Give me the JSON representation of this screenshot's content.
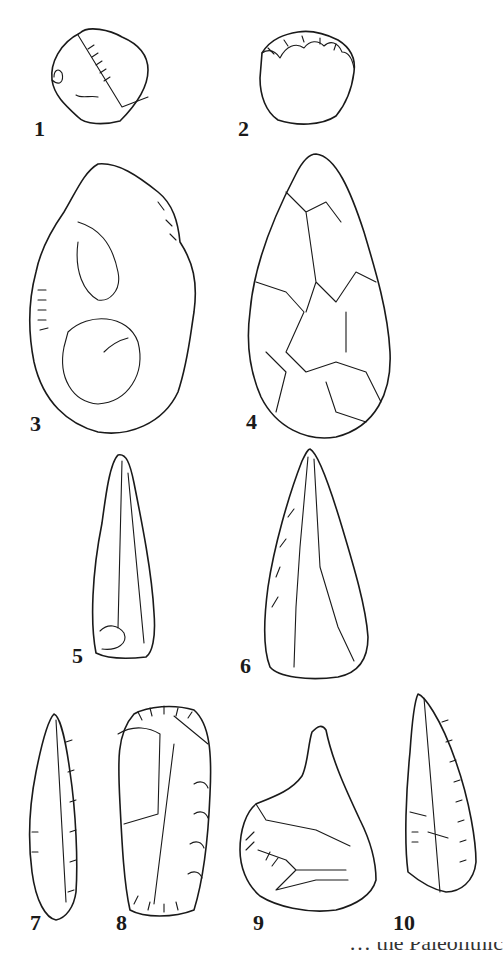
{
  "figure": {
    "items": [
      {
        "number": "1",
        "description": "flaked pebble with cortex"
      },
      {
        "number": "2",
        "description": "chopper with scalloped edge"
      },
      {
        "number": "3",
        "description": "partly flaked cobble with cortex"
      },
      {
        "number": "4",
        "description": "bifacial handaxe"
      },
      {
        "number": "5",
        "description": "elongated flake point"
      },
      {
        "number": "6",
        "description": "retouched point"
      },
      {
        "number": "7",
        "description": "narrow blade with retouched edge"
      },
      {
        "number": "8",
        "description": "end scraper on blade"
      },
      {
        "number": "9",
        "description": "retouched flake with point"
      },
      {
        "number": "10",
        "description": "burin on blade"
      }
    ],
    "caption_partial": "… the Paleolithic"
  }
}
